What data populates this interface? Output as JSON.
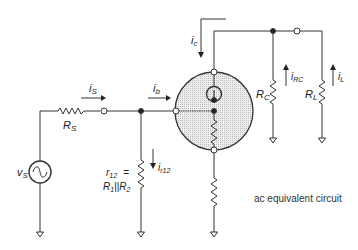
{
  "diagram": {
    "caption": "ac equivalent circuit",
    "labels": {
      "vs": "v",
      "vs_sub": "S",
      "rs": "R",
      "rs_sub": "S",
      "is": "i",
      "is_sub": "S",
      "ib": "i",
      "ib_sub": "b",
      "ic": "i",
      "ic_sub": "c",
      "r12_line1": "r",
      "r12_line1_sub": "12",
      "r12_eq": "=",
      "r12_line2_a": "R",
      "r12_line2_a_sub": "1",
      "r12_line2_par": "||",
      "r12_line2_b": "R",
      "r12_line2_b_sub": "2",
      "ir12": "i",
      "ir12_sub": "r12",
      "rc": "R",
      "rc_sub": "C",
      "irc": "i",
      "irc_sub": "RC",
      "rl": "R",
      "rl_sub": "L",
      "il": "i",
      "il_sub": "L"
    },
    "colors": {
      "line": "#333333",
      "shade": "#d9d9d9"
    }
  }
}
